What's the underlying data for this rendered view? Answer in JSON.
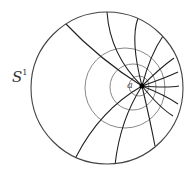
{
  "labels": {
    "circle": "S",
    "circle_sup": "1",
    "point": "a"
  },
  "colors": {
    "outer": "#444444",
    "geodesic": "#222222",
    "level": "#888888",
    "point": "#000000"
  },
  "outer_circle": {
    "cx": 107,
    "cy": 88,
    "r": 76
  },
  "point_a": {
    "x": 142,
    "y": 86
  },
  "level_circles": [
    {
      "cx": 125,
      "cy": 88,
      "r": 40
    },
    {
      "cx": 133,
      "cy": 87,
      "r": 23
    },
    {
      "cx": 139,
      "cy": 86,
      "r": 10
    }
  ],
  "geodesics": [
    "M142,86 Q100,60 64,22",
    "M142,86 Q110,55 107,12",
    "M142,86 Q130,40 138,18",
    "M142,86 Q150,55 163,36",
    "M142,86 Q160,68 174,58",
    "M142,86 Q165,78 178,72",
    "M142,86 Q168,88 179,86",
    "M142,86 Q165,95 178,104",
    "M142,86 Q160,108 173,116",
    "M142,86 Q150,120 155,146",
    "M142,86 Q120,120 115,165",
    "M142,86 Q100,110 76,157"
  ]
}
